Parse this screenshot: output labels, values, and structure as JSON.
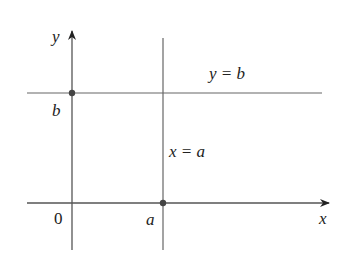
{
  "diagram": {
    "axes": {
      "x_label": "x",
      "y_label": "y",
      "origin_label": "0"
    },
    "lines": [
      {
        "name": "horizontal",
        "equation": "y = b"
      },
      {
        "name": "vertical",
        "equation": "x = a"
      }
    ],
    "points": [
      {
        "label": "b",
        "on": "y-axis"
      },
      {
        "label": "a",
        "on": "x-axis"
      }
    ],
    "colors": {
      "stroke": "#555555",
      "text": "#222222",
      "point": "#444444"
    }
  }
}
